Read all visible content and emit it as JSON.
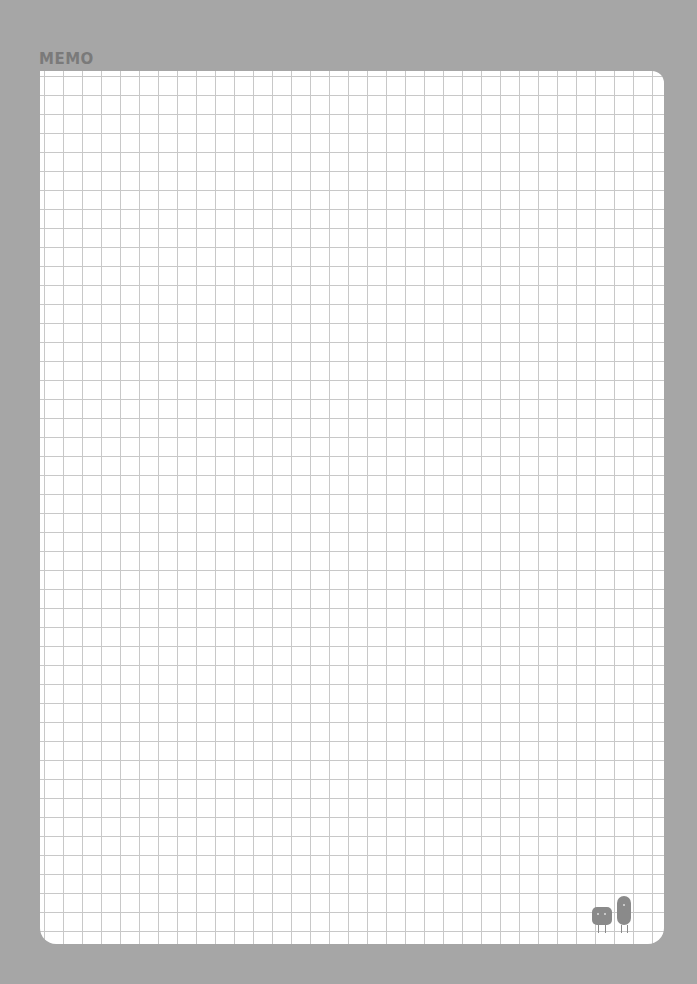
{
  "page": {
    "title": "MEMO",
    "background_color": "#a6a6a6",
    "sheet_color": "#ffffff",
    "grid_color": "#c8c8c8",
    "grid_spacing_px": 19
  },
  "decorations": {
    "mascot_left": "square-mascot",
    "mascot_right": "pill-mascot"
  }
}
